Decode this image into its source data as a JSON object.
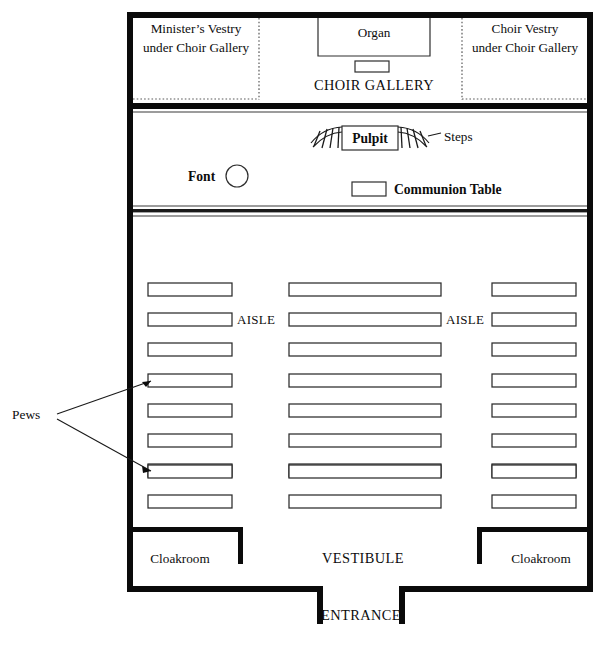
{
  "diagram": {
    "type": "church-floor-plan",
    "ink_color": "#0d0d0d",
    "paper_color": "#ffffff"
  },
  "gallery": {
    "minister_vestry": {
      "line1": "Minister’s Vestry",
      "line2": "under Choir Gallery"
    },
    "choir_vestry": {
      "line1": "Choir Vestry",
      "line2": "under Choir Gallery"
    },
    "organ_label": "Organ",
    "gallery_label": "CHOIR GALLERY"
  },
  "chancel": {
    "pulpit_label": "Pulpit",
    "steps_label": "Steps",
    "font_label": "Font",
    "communion_label": "Communion Table"
  },
  "nave": {
    "aisle_left_label": "AISLE",
    "aisle_right_label": "AISLE",
    "pews_label": "Pews",
    "pew_rows": 9,
    "pew_columns": [
      {
        "name": "left",
        "x": 148,
        "width": 84
      },
      {
        "name": "center",
        "x": 289,
        "width": 152
      },
      {
        "name": "right",
        "x": 492,
        "width": 84
      }
    ],
    "pew_row_y": [
      283,
      312,
      341,
      371,
      400,
      428,
      456,
      469,
      497
    ],
    "pew_height": 13
  },
  "vestibule": {
    "cloakroom_left_label": "Cloakroom",
    "cloakroom_right_label": "Cloakroom",
    "vestibule_label": "VESTIBULE",
    "entrance_label": "ENTRANCE"
  }
}
